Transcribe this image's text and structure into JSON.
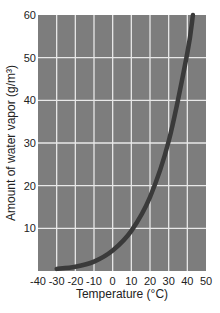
{
  "chart_data": {
    "type": "line",
    "title": "",
    "xlabel": "Temperature (°C)",
    "ylabel": "Amount of water vapor (g/m³)",
    "xlim": [
      -40,
      50
    ],
    "ylim": [
      0,
      60
    ],
    "grid": true,
    "x_ticks": [
      -40,
      -30,
      -20,
      -10,
      0,
      10,
      20,
      30,
      40,
      50
    ],
    "y_ticks": [
      10,
      20,
      30,
      40,
      50,
      60
    ],
    "series": [
      {
        "name": "Saturation water vapor",
        "x": [
          -30,
          -20,
          -10,
          0,
          10,
          20,
          30,
          40,
          43
        ],
        "values": [
          0.5,
          1,
          2.2,
          4.8,
          9.4,
          17.3,
          30.4,
          51.1,
          60
        ]
      }
    ],
    "colors": {
      "plot_background": "#7d7d7d",
      "grid": "#e8e8e8",
      "curve": "#3a3a3a"
    }
  }
}
